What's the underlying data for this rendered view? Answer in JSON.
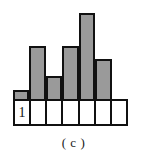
{
  "caption": "( c )",
  "cells": [
    {
      "label": "1"
    },
    {
      "label": ""
    },
    {
      "label": ""
    },
    {
      "label": ""
    },
    {
      "label": ""
    },
    {
      "label": ""
    },
    {
      "label": ""
    }
  ],
  "style": {
    "bar_fill": "#9a9a9a",
    "bar_stroke": "#111111",
    "cell_fill": "#ffffff",
    "cell_stroke": "#111111",
    "background": "#ffffff",
    "text_color": "#111111"
  },
  "chart_data": {
    "type": "bar",
    "title": "",
    "subtitle": "",
    "xlabel": "",
    "ylabel": "",
    "categories": [
      "1",
      "2",
      "3",
      "4",
      "5",
      "6",
      "7"
    ],
    "values": [
      11,
      55,
      25,
      55,
      88,
      42,
      0
    ],
    "ylim": [
      0,
      101
    ],
    "xlim": [
      0,
      7
    ],
    "grid": false,
    "legend": null,
    "annotations": [
      "( c )"
    ],
    "series": [
      {
        "name": "frequency",
        "values": [
          11,
          55,
          25,
          55,
          88,
          42,
          0
        ]
      }
    ]
  }
}
